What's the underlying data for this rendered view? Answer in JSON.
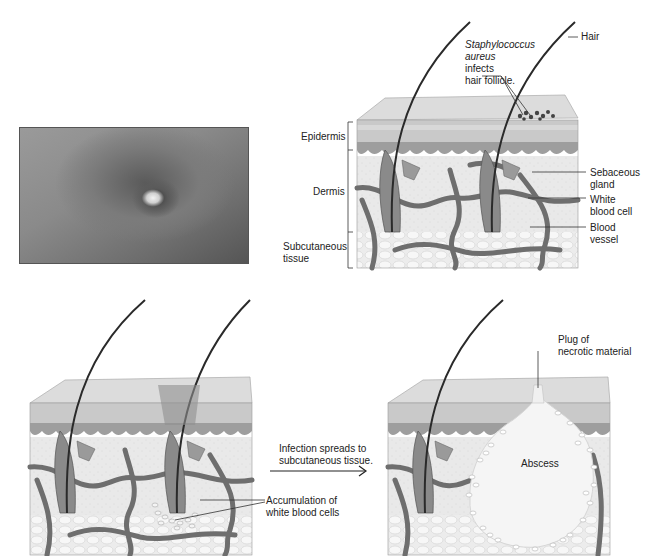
{
  "figure": {
    "photo": {
      "alt": "clinical photo of boil (furuncle) on skin"
    },
    "panel_top": {
      "labels": {
        "staph_line1": "Staphylococcus",
        "staph_line2": "aureus",
        "staph_line3": "infects",
        "staph_line4": "hair follicle.",
        "hair": "Hair",
        "epidermis": "Epidermis",
        "dermis": "Dermis",
        "subcutaneous_line1": "Subcutaneous",
        "subcutaneous_line2": "tissue",
        "sebaceous_line1": "Sebaceous",
        "sebaceous_line2": "gland",
        "wbc_line1": "White",
        "wbc_line2": "blood cell",
        "vessel_line1": "Blood",
        "vessel_line2": "vessel"
      }
    },
    "panel_bottom_left": {
      "labels": {
        "accumulation_line1": "Accumulation of",
        "accumulation_line2": "white blood cells"
      }
    },
    "transition": {
      "line1": "Infection spreads to",
      "line2": "subcutaneous tissue."
    },
    "panel_bottom_right": {
      "labels": {
        "plug_line1": "Plug of",
        "plug_line2": "necrotic material",
        "abscess": "Abscess"
      }
    },
    "colors": {
      "background": "#ffffff",
      "tissue_light": "#e6e6e6",
      "tissue_mid": "#b5b5b5",
      "vessel": "#6e6e6e",
      "hair": "#2a2a2a",
      "text": "#222222"
    }
  }
}
